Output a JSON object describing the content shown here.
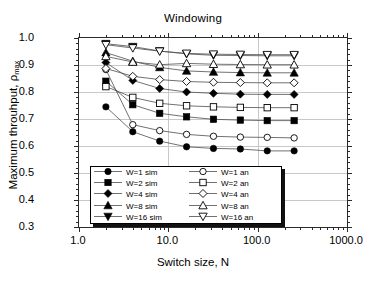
{
  "chart_data": {
    "type": "line",
    "title": "Windowing",
    "xlabel": "Switch size, N",
    "ylabel": "Maximum throuhput, ρ",
    "ylabel_sub": "max",
    "xscale": "log",
    "yscale": "linear",
    "xlim": [
      1.0,
      1000.0
    ],
    "ylim": [
      0.3,
      1.0
    ],
    "grid": true,
    "legend_position": "lower-center-inside",
    "xticks": [
      {
        "value": 1.0,
        "label": "1.0"
      },
      {
        "value": 10.0,
        "label": "10.0"
      },
      {
        "value": 100.0,
        "label": "100.0"
      },
      {
        "value": 1000.0,
        "label": "1000.0"
      }
    ],
    "yticks": [
      {
        "value": 0.3,
        "label": "0.3"
      },
      {
        "value": 0.4,
        "label": "0.4"
      },
      {
        "value": 0.5,
        "label": "0.5"
      },
      {
        "value": 0.6,
        "label": "0.6"
      },
      {
        "value": 0.7,
        "label": "0.7"
      },
      {
        "value": 0.8,
        "label": "0.8"
      },
      {
        "value": 0.9,
        "label": "0.9"
      },
      {
        "value": 1.0,
        "label": "1.0"
      }
    ],
    "x": [
      2,
      4,
      8,
      16,
      32,
      64,
      128,
      256
    ],
    "series": [
      {
        "name": "W=1 sim",
        "marker": "circle-filled",
        "filled": true,
        "values": [
          0.745,
          0.653,
          0.618,
          0.597,
          0.591,
          0.589,
          0.582,
          0.582
        ]
      },
      {
        "name": "W=2 sim",
        "marker": "square-filled",
        "filled": true,
        "values": [
          0.84,
          0.753,
          0.721,
          0.708,
          0.699,
          0.696,
          0.694,
          0.694
        ]
      },
      {
        "name": "W=4 sim",
        "marker": "diamond-filled",
        "filled": true,
        "values": [
          0.909,
          0.843,
          0.813,
          0.8,
          0.795,
          0.792,
          0.791,
          0.791
        ]
      },
      {
        "name": "W=8 sim",
        "marker": "triangle-up-filled",
        "filled": true,
        "values": [
          0.946,
          0.914,
          0.891,
          0.878,
          0.874,
          0.872,
          0.871,
          0.871
        ]
      },
      {
        "name": "W=16 sim",
        "marker": "triangle-down-filled",
        "filled": true,
        "values": [
          0.979,
          0.968,
          0.952,
          0.941,
          0.936,
          0.935,
          0.934,
          0.934
        ]
      },
      {
        "name": "W=1 an",
        "marker": "circle-open",
        "filled": false,
        "values": [
          0.883,
          0.679,
          0.657,
          0.643,
          0.636,
          0.633,
          0.632,
          0.63
        ]
      },
      {
        "name": "W=2 an",
        "marker": "square-open",
        "filled": false,
        "values": [
          0.82,
          0.78,
          0.758,
          0.749,
          0.745,
          0.743,
          0.742,
          0.742
        ]
      },
      {
        "name": "W=4 an",
        "marker": "diamond-open",
        "filled": false,
        "values": [
          0.887,
          0.858,
          0.846,
          0.839,
          0.836,
          0.835,
          0.834,
          0.834
        ]
      },
      {
        "name": "W=8 an",
        "marker": "triangle-up-open",
        "filled": false,
        "values": [
          0.932,
          0.911,
          0.901,
          0.906,
          0.903,
          0.902,
          0.901,
          0.901
        ]
      },
      {
        "name": "W=16 an",
        "marker": "triangle-down-open",
        "filled": false,
        "values": [
          0.975,
          0.963,
          0.951,
          0.943,
          0.94,
          0.939,
          0.938,
          0.938
        ]
      }
    ],
    "colors": {
      "line": "#4d4d4d",
      "marker": "#000000",
      "frame": "#2a2a2a",
      "grid": "#c8c8c8"
    },
    "legend": {
      "left_column": [
        "W=1 sim",
        "W=2 sim",
        "W=4 sim",
        "W=8 sim",
        "W=16 sim"
      ],
      "right_column": [
        "W=1 an",
        "W=2 an",
        "W=4 an",
        "W=8 an",
        "W=16 an"
      ]
    }
  }
}
